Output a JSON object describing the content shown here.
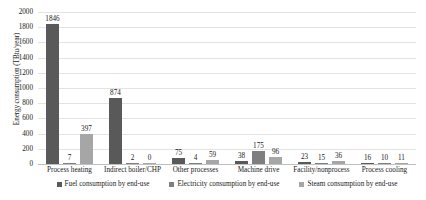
{
  "chart_data": {
    "type": "bar",
    "title": "",
    "xlabel": "",
    "ylabel": "Energy consumption (TBtu/year)",
    "ylim": [
      0,
      2000
    ],
    "ytick_step": 200,
    "yticks": [
      "0",
      "200",
      "400",
      "600",
      "800",
      "1000",
      "1200",
      "1400",
      "1600",
      "1800",
      "2000"
    ],
    "grid": true,
    "legend_position": "bottom",
    "categories": [
      "Process heating",
      "Indirect boiler/CHP",
      "Other processes",
      "Machine drive",
      "Facility/nonprocess",
      "Process cooling"
    ],
    "series": [
      {
        "name": "Fuel consumption by end-use",
        "color": "#595959",
        "values": [
          1846,
          874,
          75,
          38,
          23,
          16
        ]
      },
      {
        "name": "Electricity consumption by end-use",
        "color": "#7f7f7f",
        "values": [
          7,
          2,
          4,
          175,
          15,
          10
        ]
      },
      {
        "name": "Steam consumption by end-use",
        "color": "#a6a6a6",
        "values": [
          397,
          0,
          59,
          96,
          36,
          11
        ]
      }
    ]
  },
  "colors": {
    "gridline": "#e3e3e3",
    "axis": "#bfbfbf",
    "background": "#ffffff",
    "text": "#1a1a1a"
  }
}
